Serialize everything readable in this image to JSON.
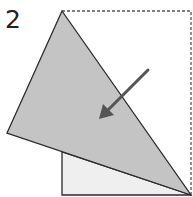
{
  "diagram": {
    "step_number": "2",
    "colors": {
      "flap_fill": "#c4c4c4",
      "under_fill": "#efefef",
      "outline": "#2a2a2a",
      "arrow": "#555555",
      "dashed_outline": "#555555"
    },
    "shapes": {
      "dashed_square": {
        "x1": 62,
        "y1": 11,
        "x2": 191,
        "y2": 195
      },
      "under_triangle": [
        [
          62,
          152
        ],
        [
          62,
          195
        ],
        [
          191,
          195
        ]
      ],
      "folded_flap": [
        [
          62,
          11
        ],
        [
          191,
          195
        ],
        [
          7,
          133
        ]
      ],
      "arrow": {
        "from": [
          148,
          70
        ],
        "to": [
          100,
          118
        ]
      }
    }
  }
}
